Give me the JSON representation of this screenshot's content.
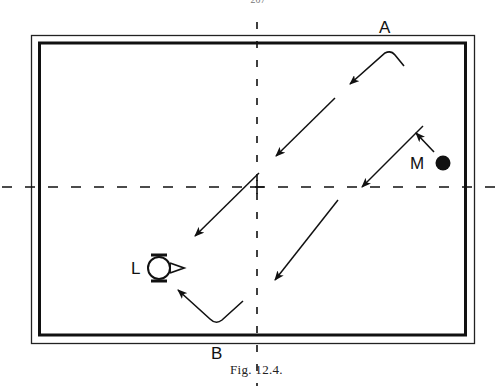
{
  "page": {
    "page_number_partial": "207"
  },
  "figure": {
    "caption": "Fig. 12.4.",
    "labels": {
      "A": "A",
      "B": "B",
      "M": "M",
      "L": "L"
    },
    "elements": {
      "frame": "double-line rectangular border (thin outer, thick inner)",
      "axes": "dashed vertical and horizontal center lines crossing at '+'",
      "M_marker": "filled circle",
      "L_marker": "lamp symbol: open circle with bars top and bottom and triangle on right",
      "arrows": "parallel diagonal arrows pointing down-left, hooked arrows at A and B"
    },
    "colors": {
      "ink": "#111111",
      "background": "#ffffff"
    }
  }
}
